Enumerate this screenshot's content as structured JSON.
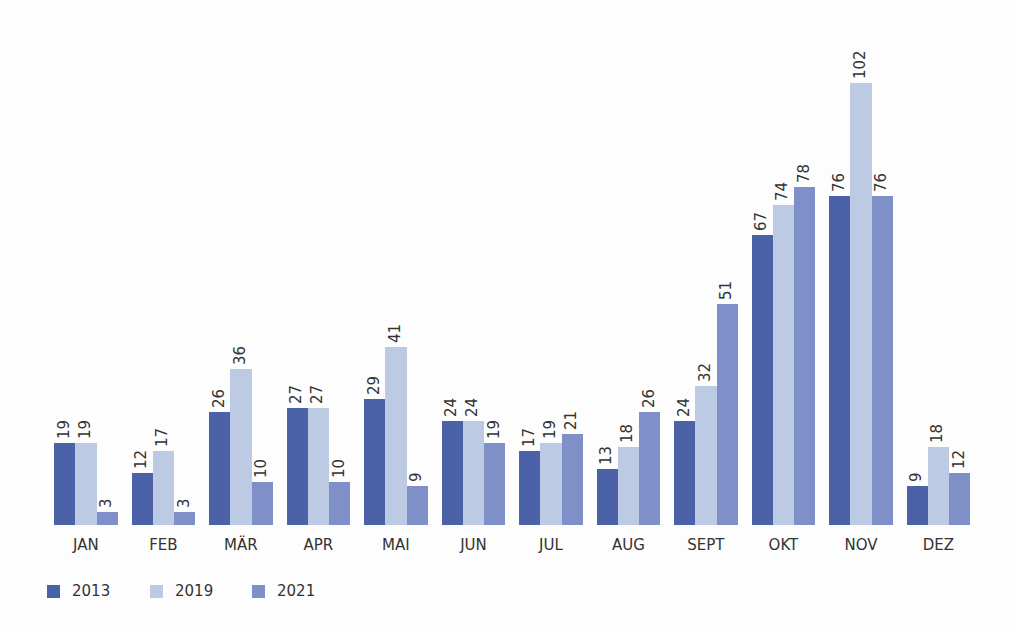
{
  "chart_data": {
    "type": "bar",
    "title": "",
    "xlabel": "",
    "ylabel": "",
    "grid": false,
    "legend_position": "bottom-left",
    "ylim": [
      0,
      105
    ],
    "categories": [
      "JAN",
      "FEB",
      "MÄR",
      "APR",
      "MAI",
      "JUN",
      "JUL",
      "AUG",
      "SEPT",
      "OKT",
      "NOV",
      "DEZ"
    ],
    "series": [
      {
        "name": "2013",
        "color": "#4b62a8",
        "values": [
          19,
          12,
          26,
          27,
          29,
          24,
          17,
          13,
          24,
          67,
          76,
          9
        ]
      },
      {
        "name": "2019",
        "color": "#bccae3",
        "values": [
          19,
          17,
          36,
          27,
          41,
          24,
          19,
          18,
          32,
          74,
          102,
          18
        ]
      },
      {
        "name": "2021",
        "color": "#7f8fc8",
        "values": [
          3,
          3,
          10,
          10,
          9,
          19,
          21,
          26,
          51,
          78,
          76,
          12
        ]
      }
    ],
    "data_labels": true,
    "value_label_orientation": "vertical"
  },
  "legend": [
    {
      "label": "2013",
      "color": "#4b62a8"
    },
    {
      "label": "2019",
      "color": "#bccae3"
    },
    {
      "label": "2021",
      "color": "#7f8fc8"
    }
  ]
}
